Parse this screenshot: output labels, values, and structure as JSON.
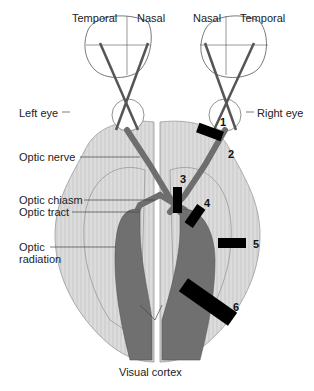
{
  "visual_fields": {
    "left": {
      "temporal": "Temporal",
      "nasal": "Nasal"
    },
    "right": {
      "nasal": "Nasal",
      "temporal": "Temporal"
    }
  },
  "labels": {
    "left_eye": "Left eye",
    "right_eye": "Right eye",
    "optic_nerve": "Optic nerve",
    "optic_chiasm": "Optic chiasm",
    "optic_tract": "Optic tract",
    "optic_radiation_1": "Optic",
    "optic_radiation_2": "radiation",
    "visual_cortex": "Visual cortex"
  },
  "lesions": [
    "1",
    "2",
    "3",
    "4",
    "5",
    "6"
  ],
  "colors": {
    "brain": "#d9d9d9",
    "pathway": "#6e6e6e",
    "lesion": "#000000",
    "outline": "#8a8a8a"
  }
}
